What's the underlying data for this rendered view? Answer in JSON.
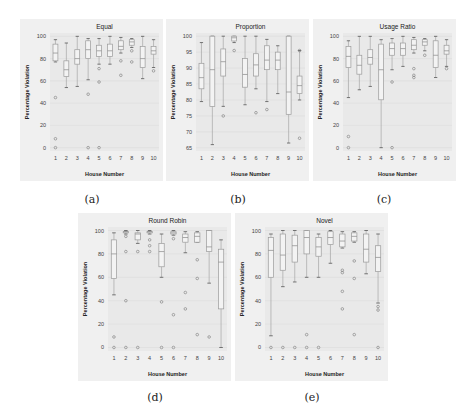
{
  "figure": {
    "captions": [
      "(a)",
      "(b)",
      "(c)",
      "(d)",
      "(e)"
    ]
  },
  "chart_data": [
    {
      "type": "box",
      "title": "Equal",
      "xlabel": "House Number",
      "ylabel": "Percentage Violation",
      "categories": [
        "1",
        "2",
        "3",
        "4",
        "5",
        "6",
        "7",
        "8",
        "9",
        "10"
      ],
      "ylim": [
        -3,
        103
      ],
      "yticks": [
        0,
        20,
        40,
        60,
        80,
        100
      ],
      "grid": true,
      "boxes": [
        {
          "min": 77,
          "q1": 78,
          "median": 85,
          "q3": 93,
          "max": 97,
          "outliers": [
            45,
            8,
            0
          ]
        },
        {
          "min": 54,
          "q1": 64,
          "median": 70,
          "q3": 78,
          "max": 94,
          "outliers": []
        },
        {
          "min": 55,
          "q1": 75,
          "median": 80,
          "q3": 88,
          "max": 100,
          "outliers": []
        },
        {
          "min": 61,
          "q1": 80,
          "median": 88,
          "q3": 96,
          "max": 98,
          "outliers": [
            48,
            0
          ]
        },
        {
          "min": 75,
          "q1": 82,
          "median": 87,
          "q3": 92,
          "max": 98,
          "outliers": [
            71,
            59,
            0
          ]
        },
        {
          "min": 75,
          "q1": 82,
          "median": 87,
          "q3": 93,
          "max": 100,
          "outliers": []
        },
        {
          "min": 85,
          "q1": 88,
          "median": 91,
          "q3": 96,
          "max": 99,
          "outliers": [
            78,
            65
          ]
        },
        {
          "min": 90,
          "q1": 92,
          "median": 95,
          "q3": 97,
          "max": 98,
          "outliers": [
            87,
            77
          ]
        },
        {
          "min": 62,
          "q1": 72,
          "median": 80,
          "q3": 91,
          "max": 100,
          "outliers": []
        },
        {
          "min": 72,
          "q1": 84,
          "median": 87,
          "q3": 91,
          "max": 97,
          "outliers": [
            69
          ]
        }
      ]
    },
    {
      "type": "box",
      "title": "Proportion",
      "xlabel": "House Number",
      "ylabel": "Percentage Violation",
      "categories": [
        "1",
        "2",
        "3",
        "4",
        "5",
        "6",
        "7",
        "8",
        "9",
        "10"
      ],
      "ylim": [
        64,
        101
      ],
      "yticks": [
        65,
        70,
        75,
        80,
        85,
        90,
        95,
        100
      ],
      "grid": true,
      "boxes": [
        {
          "min": 79.5,
          "q1": 83.5,
          "median": 87,
          "q3": 91.5,
          "max": 98,
          "outliers": []
        },
        {
          "min": 66,
          "q1": 78,
          "median": 89.5,
          "q3": 100,
          "max": 100,
          "outliers": []
        },
        {
          "min": 78,
          "q1": 87.5,
          "median": 92,
          "q3": 96,
          "max": 100,
          "outliers": [
            75
          ]
        },
        {
          "min": 98,
          "q1": 98.5,
          "median": 99.5,
          "q3": 100,
          "max": 100,
          "outliers": [
            95.5
          ]
        },
        {
          "min": 78.5,
          "q1": 84,
          "median": 88,
          "q3": 93,
          "max": 100,
          "outliers": []
        },
        {
          "min": 83.5,
          "q1": 87.5,
          "median": 91,
          "q3": 94.5,
          "max": 100,
          "outliers": [
            76
          ]
        },
        {
          "min": 79.5,
          "q1": 89.5,
          "median": 92.5,
          "q3": 97,
          "max": 99,
          "outliers": [
            77
          ]
        },
        {
          "min": 82,
          "q1": 89.5,
          "median": 92.5,
          "q3": 95,
          "max": 97,
          "outliers": []
        },
        {
          "min": 66.5,
          "q1": 75.5,
          "median": 82.5,
          "q3": 100,
          "max": 100,
          "outliers": []
        },
        {
          "min": 80,
          "q1": 82,
          "median": 84.5,
          "q3": 87.5,
          "max": 95.5,
          "outliers": [
            68,
            95.5
          ]
        }
      ]
    },
    {
      "type": "box",
      "title": "Usage Ratio",
      "xlabel": "House Number",
      "ylabel": "Percentage Violation",
      "categories": [
        "1",
        "2",
        "3",
        "4",
        "5",
        "6",
        "7",
        "8",
        "9",
        "10"
      ],
      "ylim": [
        -3,
        103
      ],
      "yticks": [
        0,
        20,
        40,
        60,
        80,
        100
      ],
      "grid": true,
      "boxes": [
        {
          "min": 45,
          "q1": 72,
          "median": 82,
          "q3": 91,
          "max": 96,
          "outliers": [
            10,
            0
          ]
        },
        {
          "min": 52,
          "q1": 66,
          "median": 74,
          "q3": 83,
          "max": 100,
          "outliers": []
        },
        {
          "min": 55,
          "q1": 75,
          "median": 81,
          "q3": 88,
          "max": 100,
          "outliers": []
        },
        {
          "min": 0,
          "q1": 43,
          "median": 70,
          "q3": 93,
          "max": 97,
          "outliers": []
        },
        {
          "min": 70,
          "q1": 83,
          "median": 89,
          "q3": 94,
          "max": 98,
          "outliers": [
            59,
            0
          ]
        },
        {
          "min": 73,
          "q1": 83,
          "median": 89,
          "q3": 94,
          "max": 100,
          "outliers": []
        },
        {
          "min": 85,
          "q1": 88,
          "median": 92,
          "q3": 97,
          "max": 99,
          "outliers": [
            71,
            65,
            63
          ]
        },
        {
          "min": 87,
          "q1": 92,
          "median": 95,
          "q3": 97,
          "max": 98,
          "outliers": [
            83
          ]
        },
        {
          "min": 63,
          "q1": 72,
          "median": 83,
          "q3": 96,
          "max": 100,
          "outliers": []
        },
        {
          "min": 73,
          "q1": 84,
          "median": 87,
          "q3": 92,
          "max": 97,
          "outliers": [
            71
          ]
        }
      ]
    },
    {
      "type": "box",
      "title": "Round Robin",
      "xlabel": "House Number",
      "ylabel": "Percentage Violation",
      "categories": [
        "1",
        "2",
        "3",
        "4",
        "5",
        "6",
        "7",
        "8",
        "9",
        "10"
      ],
      "ylim": [
        -3,
        103
      ],
      "yticks": [
        0,
        20,
        40,
        60,
        80,
        100
      ],
      "grid": true,
      "boxes": [
        {
          "min": 45,
          "q1": 59,
          "median": 80,
          "q3": 92,
          "max": 98,
          "outliers": [
            9,
            0
          ]
        },
        {
          "min": 97,
          "q1": 98,
          "median": 99,
          "q3": 99,
          "max": 100,
          "outliers": [
            95,
            82,
            40,
            0
          ]
        },
        {
          "min": 89,
          "q1": 92,
          "median": 97,
          "q3": 98,
          "max": 100,
          "outliers": [
            82,
            0
          ]
        },
        {
          "min": 97,
          "q1": 98,
          "median": 99,
          "q3": 99,
          "max": 100,
          "outliers": [
            92,
            87,
            82
          ]
        },
        {
          "min": 60,
          "q1": 69,
          "median": 82,
          "q3": 89,
          "max": 97,
          "outliers": [
            39,
            0
          ]
        },
        {
          "min": 96,
          "q1": 97,
          "median": 98,
          "q3": 99,
          "max": 100,
          "outliers": [
            93,
            28,
            0
          ]
        },
        {
          "min": 81,
          "q1": 90,
          "median": 94,
          "q3": 97,
          "max": 99,
          "outliers": [
            47,
            33
          ]
        },
        {
          "min": 90,
          "q1": 90,
          "median": 95,
          "q3": 98,
          "max": 99,
          "outliers": [
            75,
            59,
            11
          ]
        },
        {
          "min": 55,
          "q1": 82,
          "median": 86,
          "q3": 100,
          "max": 100,
          "outliers": [
            9
          ]
        },
        {
          "min": 0,
          "q1": 33,
          "median": 73,
          "q3": 84,
          "max": 92,
          "outliers": []
        }
      ]
    },
    {
      "type": "box",
      "title": "Novel",
      "xlabel": "House Number",
      "ylabel": "Percentage Violation",
      "categories": [
        "1",
        "2",
        "3",
        "4",
        "5",
        "6",
        "7",
        "8",
        "9",
        "10"
      ],
      "ylim": [
        -3,
        103
      ],
      "yticks": [
        0,
        20,
        40,
        60,
        80,
        100
      ],
      "grid": true,
      "boxes": [
        {
          "min": 10,
          "q1": 60,
          "median": 83,
          "q3": 94,
          "max": 97,
          "outliers": [
            0
          ]
        },
        {
          "min": 52,
          "q1": 66,
          "median": 79,
          "q3": 97,
          "max": 100,
          "outliers": [
            0
          ]
        },
        {
          "min": 56,
          "q1": 73,
          "median": 87,
          "q3": 96,
          "max": 100,
          "outliers": [
            0
          ]
        },
        {
          "min": 60,
          "q1": 80,
          "median": 94,
          "q3": 100,
          "max": 100,
          "outliers": [
            11,
            0
          ]
        },
        {
          "min": 60,
          "q1": 78,
          "median": 86,
          "q3": 94,
          "max": 97,
          "outliers": [
            0
          ]
        },
        {
          "min": 72,
          "q1": 88,
          "median": 94,
          "q3": 99,
          "max": 100,
          "outliers": []
        },
        {
          "min": 85,
          "q1": 86,
          "median": 91,
          "q3": 97,
          "max": 99,
          "outliers": [
            66,
            64,
            48,
            33
          ]
        },
        {
          "min": 90,
          "q1": 91,
          "median": 95,
          "q3": 98,
          "max": 99,
          "outliers": [
            74,
            59,
            11
          ]
        },
        {
          "min": 63,
          "q1": 73,
          "median": 84,
          "q3": 97,
          "max": 100,
          "outliers": []
        },
        {
          "min": 38,
          "q1": 65,
          "median": 77,
          "q3": 87,
          "max": 97,
          "outliers": [
            35,
            32,
            0
          ]
        }
      ]
    }
  ]
}
